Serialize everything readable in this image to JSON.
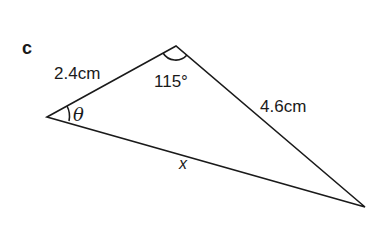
{
  "diagram": {
    "part_label": "c",
    "type": "triangle",
    "vertices": {
      "left": {
        "x": 47,
        "y": 117
      },
      "top": {
        "x": 176,
        "y": 46
      },
      "right": {
        "x": 365,
        "y": 207
      }
    },
    "sides": {
      "left_top": "2.4cm",
      "top_right": "4.6cm",
      "left_right": "x"
    },
    "angles": {
      "top": "115°",
      "left": "θ"
    },
    "colors": {
      "line": "#1a1a1a",
      "background": "#ffffff"
    }
  }
}
